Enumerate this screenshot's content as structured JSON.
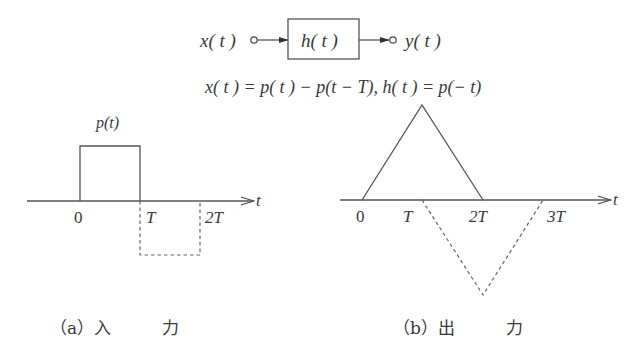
{
  "block_diagram": {
    "input_label": "x( t )",
    "system_label": "h( t )",
    "output_label": "y( t )"
  },
  "equation": "x( t ) = p( t ) − p(t − T),  h( t ) = p(− t)",
  "panel_a": {
    "pulse_label": "p(t)",
    "axis_label": "t",
    "ticks": [
      "0",
      "T",
      "2T"
    ],
    "caption": "（a）入　　　力"
  },
  "panel_b": {
    "axis_label": "t",
    "ticks": [
      "0",
      "T",
      "2T",
      "3T"
    ],
    "caption": "（b）出　　　力"
  },
  "colors": {
    "line": "#555555",
    "text": "#3a3a3a",
    "background": "#ffffff"
  }
}
